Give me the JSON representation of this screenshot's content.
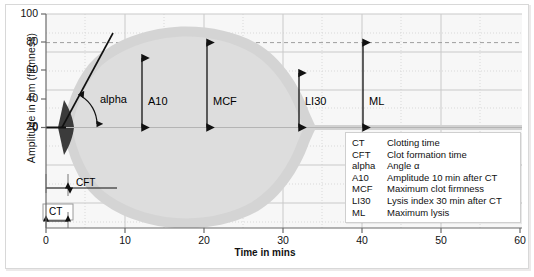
{
  "axes": {
    "y_label": "Amplitude in mm (firmness)",
    "x_label": "Time in mins",
    "y_ticks": [
      "0",
      "20",
      "40",
      "60",
      "80",
      "100"
    ],
    "x_ticks": [
      "0",
      "10",
      "20",
      "30",
      "40",
      "50",
      "60"
    ]
  },
  "annotations": {
    "alpha": "alpha",
    "a10": "A10",
    "mcf": "MCF",
    "li30": "LI30",
    "ml": "ML",
    "cft": "CFT",
    "ct": "CT"
  },
  "legend": {
    "rows": [
      {
        "abbr": "CT",
        "desc": "Clotting time"
      },
      {
        "abbr": "CFT",
        "desc": "Clot formation time"
      },
      {
        "abbr": "alpha",
        "desc": "Angle α"
      },
      {
        "abbr": "A10",
        "desc": "Amplitude 10 min after CT"
      },
      {
        "abbr": "MCF",
        "desc": "Maximum clot firmness"
      },
      {
        "abbr": "LI30",
        "desc": "Lysis index 30 min after CT"
      },
      {
        "abbr": "ML",
        "desc": "Maximum lysis"
      }
    ]
  },
  "colors": {
    "blob": "#d2d2d2",
    "blob_inner": "#dcdcdc",
    "wedge": "#3a3a3a",
    "grid_major": "#c9c9c9",
    "grid_minor": "#d9d9d9",
    "axis": "#555555",
    "arrow": "#111111",
    "panel_bg": "#f7f7f7"
  },
  "chart_data": {
    "type": "area",
    "xlabel": "Time in mins",
    "ylabel": "Amplitude in mm (firmness)",
    "xlim": [
      0,
      60
    ],
    "ylim": [
      -100,
      100
    ],
    "grid": true,
    "legend_position": "inside-bottom-right",
    "series": [
      {
        "name": "Clot firmness envelope (upper)",
        "x": [
          4,
          5,
          7,
          10,
          13,
          16,
          19,
          22,
          25,
          28,
          31,
          34,
          37,
          39,
          41,
          43
        ],
        "values": [
          0,
          12,
          32,
          52,
          64,
          71,
          75,
          76,
          74,
          69,
          61,
          50,
          34,
          22,
          10,
          0
        ]
      },
      {
        "name": "Clot firmness envelope (lower mirror)",
        "x": [
          4,
          5,
          7,
          10,
          13,
          16,
          19,
          22,
          25,
          28,
          31,
          34,
          37,
          39,
          41,
          43
        ],
        "values": [
          0,
          -12,
          -32,
          -52,
          -64,
          -71,
          -75,
          -76,
          -74,
          -69,
          -61,
          -50,
          -34,
          -22,
          -10,
          0
        ]
      },
      {
        "name": "Alpha tangent line",
        "x": [
          4.2,
          10.5
        ],
        "values": [
          0,
          85
        ]
      },
      {
        "name": "Residual lysis tail",
        "x": [
          43,
          58
        ],
        "values": [
          1.5,
          1.5
        ]
      }
    ],
    "markers": [
      {
        "label": "CT",
        "type": "horizontal-span",
        "x_start": 0,
        "x_end": 4,
        "y": -86,
        "meaning": "Clotting time"
      },
      {
        "label": "CFT",
        "type": "horizontal-span",
        "x_start": 4,
        "x_end": 12.5,
        "y": -60,
        "meaning": "Clot formation time"
      },
      {
        "label": "alpha",
        "type": "angle",
        "x": 4.2,
        "y": 0,
        "meaning": "Angle alpha between baseline and tangent"
      },
      {
        "label": "A10",
        "type": "vertical-span",
        "x": 13,
        "y_start": 0,
        "y_end": 64,
        "value": 64,
        "meaning": "Amplitude 10 min after CT"
      },
      {
        "label": "MCF",
        "type": "vertical-span",
        "x": 22,
        "y_start": 0,
        "y_end": 76,
        "value": 76,
        "meaning": "Maximum clot firmness"
      },
      {
        "label": "LI30",
        "type": "vertical-span",
        "x": 34,
        "y_start": 0,
        "y_end": 50,
        "value": 50,
        "meaning": "Lysis index 30 min after CT"
      },
      {
        "label": "ML",
        "type": "vertical-span",
        "x": 40,
        "y_start": 0,
        "y_end": 76,
        "value": 76,
        "meaning": "Maximum lysis"
      }
    ],
    "reference_lines": [
      {
        "label": "MCF level",
        "orientation": "horizontal",
        "y": 76,
        "style": "dashed"
      }
    ]
  }
}
